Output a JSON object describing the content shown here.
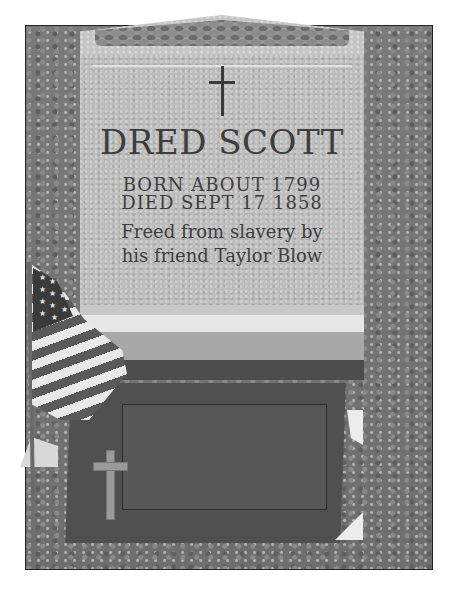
{
  "image": {
    "subject": "Gravestone of Dred Scott",
    "style": "grayscale photograph",
    "headstone": {
      "cross_glyph": "✝",
      "name": "DRED SCOTT",
      "born": "BORN ABOUT 1799",
      "died": "DIED SEPT 17 1858",
      "inscription_line1": "Freed from slavery by",
      "inscription_line2": "his friend Taylor Blow"
    },
    "plaque": {
      "lines": [
        "",
        "",
        "",
        "",
        "",
        "",
        ""
      ],
      "legibility": "illegible"
    },
    "flag": "american-flag",
    "colors": {
      "stone": "#bdbdbd",
      "engraving": "#3d3d3d",
      "grass": "#7a7a7a",
      "plaque": "#505050",
      "frame_border": "#222222",
      "page_background": "#ffffff"
    }
  }
}
